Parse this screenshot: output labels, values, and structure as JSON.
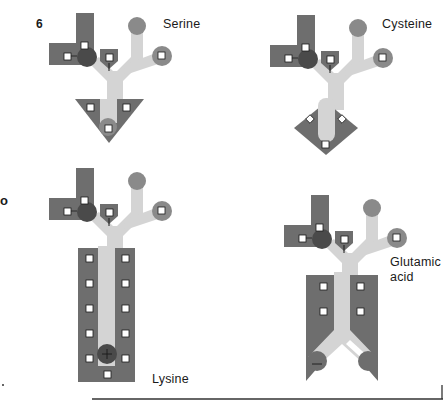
{
  "figure": {
    "number": "6",
    "stray_glyph": "o",
    "colors": {
      "dark_block": "#6e6e6e",
      "dark_circle": "#4a4a4a",
      "light_backbone": "#d4d4d4",
      "medium_circle": "#8a8a8a",
      "node_fill": "#ffffff",
      "node_stroke": "#1a1a1a",
      "rule": "#333333"
    }
  },
  "molecules": [
    {
      "id": "serine",
      "label": "Serine",
      "side_chain_shape": "triangle",
      "side_chain_nodes": 3
    },
    {
      "id": "cysteine",
      "label": "Cysteine",
      "side_chain_shape": "diamond",
      "side_chain_nodes": 3
    },
    {
      "id": "lysine",
      "label": "Lysine",
      "side_chain_shape": "long-rectangle",
      "side_chain_nodes": 11,
      "charge": "+"
    },
    {
      "id": "glutamic-acid",
      "label_line1": "Glutamic",
      "label_line2": "acid",
      "side_chain_shape": "forked-rectangle",
      "side_chain_nodes": 4,
      "charge": "−"
    }
  ]
}
